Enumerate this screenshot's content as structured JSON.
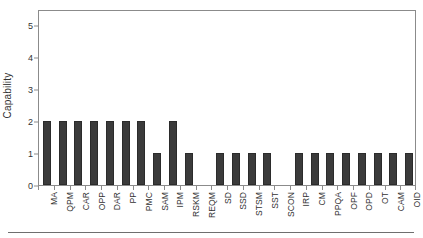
{
  "chart_data": {
    "type": "bar",
    "title": "",
    "subtitle": "",
    "xlabel": "",
    "ylabel": "Capability",
    "categories": [
      "MA",
      "QPM",
      "CAR",
      "OPP",
      "DAR",
      "PP",
      "PMC",
      "SAM",
      "IPM",
      "RSKM",
      "REQM",
      "SD",
      "SSD",
      "STSM",
      "SST",
      "SCON",
      "IRP",
      "CM",
      "PPQA",
      "OPF",
      "OPD",
      "OT",
      "CAM",
      "OID"
    ],
    "values": [
      2,
      2,
      2,
      2,
      2,
      2,
      2,
      1,
      2,
      1,
      0,
      1,
      1,
      1,
      1,
      0,
      1,
      1,
      1,
      1,
      1,
      1,
      1,
      1
    ],
    "ylim": [
      0,
      5.5
    ],
    "yticks": [
      0,
      1,
      2,
      3,
      4,
      5
    ],
    "ytick_labels": [
      "0",
      "1",
      "2",
      "3",
      "4",
      "5"
    ],
    "grid": false,
    "legend": null,
    "legend_position": "none",
    "annotations": [],
    "bar_color": "#3b3b3b",
    "bar_edge_color": "#2b2b2b",
    "axis_color": "#8b8b8b",
    "text_color": "#333333",
    "background": "#ffffff"
  }
}
